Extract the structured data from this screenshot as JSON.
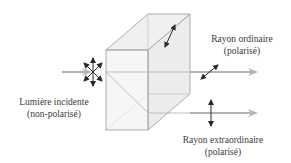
{
  "diagram": {
    "labels": {
      "incident": {
        "line1": "Lumière incidente",
        "line2": "(non-polarisé)"
      },
      "ordinary": {
        "line1": "Rayon ordinaire",
        "line2": "(polarisé)"
      },
      "extraordinary": {
        "line1": "Rayon extraordinaire",
        "line2": "(polarisé)"
      }
    },
    "elements": [
      {
        "id": "incident-beam",
        "kind": "arrow",
        "description": "incoming unpolarized light beam"
      },
      {
        "id": "unpolarized-symbol",
        "kind": "star-of-arrows",
        "description": "polarization in all directions"
      },
      {
        "id": "crystal",
        "kind": "3d-box",
        "description": "birefringent crystal"
      },
      {
        "id": "ordinary-ray",
        "kind": "arrow",
        "description": "straight-through ray"
      },
      {
        "id": "extraordinary-ray",
        "kind": "arrow",
        "description": "displaced ray"
      },
      {
        "id": "ordinary-polarization",
        "kind": "double-arrow",
        "description": "diagonal polarization"
      },
      {
        "id": "extraordinary-polarization",
        "kind": "double-arrow",
        "description": "vertical polarization"
      },
      {
        "id": "crystal-axis",
        "kind": "double-arrow",
        "description": "optical axis on back face"
      }
    ],
    "colors": {
      "beam": "#b0b0b0",
      "crystal_fill": "#eeeeee",
      "crystal_edge": "#9a9a9a",
      "arrow": "#2a2a2a",
      "text": "#3a3a3a"
    }
  }
}
